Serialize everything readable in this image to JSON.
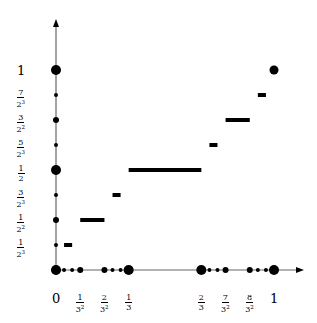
{
  "chart_data": {
    "type": "step",
    "title": "",
    "xlabel": "",
    "ylabel": "",
    "xlim": [
      0,
      1
    ],
    "ylim": [
      0,
      1
    ],
    "grid": false,
    "x_ticks": [
      {
        "value": 0,
        "num": "0",
        "den": ""
      },
      {
        "value": 0.1111,
        "num": "1",
        "den": "3",
        "den_exp": "2"
      },
      {
        "value": 0.2222,
        "num": "2",
        "den": "3",
        "den_exp": "2"
      },
      {
        "value": 0.3333,
        "num": "1",
        "den": "3"
      },
      {
        "value": 0.6667,
        "num": "2",
        "den": "3"
      },
      {
        "value": 0.7778,
        "num": "7",
        "den": "3",
        "den_exp": "2"
      },
      {
        "value": 0.8889,
        "num": "8",
        "den": "3",
        "den_exp": "2"
      },
      {
        "value": 1,
        "num": "1",
        "den": ""
      }
    ],
    "y_ticks": [
      {
        "value": 0.125,
        "num": "1",
        "den": "2",
        "den_exp": "3"
      },
      {
        "value": 0.25,
        "num": "1",
        "den": "2",
        "den_exp": "2"
      },
      {
        "value": 0.375,
        "num": "3",
        "den": "2",
        "den_exp": "3"
      },
      {
        "value": 0.5,
        "num": "1",
        "den": "2"
      },
      {
        "value": 0.625,
        "num": "5",
        "den": "2",
        "den_exp": "3"
      },
      {
        "value": 0.75,
        "num": "3",
        "den": "2",
        "den_exp": "2"
      },
      {
        "value": 0.875,
        "num": "7",
        "den": "2",
        "den_exp": "3"
      },
      {
        "value": 1,
        "num": "1",
        "den": ""
      }
    ],
    "segments": [
      {
        "x0": 0.037,
        "x1": 0.0741,
        "y": 0.125
      },
      {
        "x0": 0.1111,
        "x1": 0.2222,
        "y": 0.25
      },
      {
        "x0": 0.2593,
        "x1": 0.2963,
        "y": 0.375
      },
      {
        "x0": 0.3333,
        "x1": 0.6667,
        "y": 0.5
      },
      {
        "x0": 0.7037,
        "x1": 0.7407,
        "y": 0.625
      },
      {
        "x0": 0.7778,
        "x1": 0.8889,
        "y": 0.75
      },
      {
        "x0": 0.9259,
        "x1": 0.963,
        "y": 0.875
      }
    ],
    "points": [
      {
        "x": 0,
        "y": 0,
        "size": "large"
      },
      {
        "x": 1,
        "y": 1,
        "size": "large"
      }
    ],
    "x_axis_dots": [
      {
        "x": 0,
        "size": "large"
      },
      {
        "x": 0.037,
        "size": "small"
      },
      {
        "x": 0.0741,
        "size": "small"
      },
      {
        "x": 0.1111,
        "size": "medium"
      },
      {
        "x": 0.2222,
        "size": "medium"
      },
      {
        "x": 0.2593,
        "size": "small"
      },
      {
        "x": 0.2963,
        "size": "small"
      },
      {
        "x": 0.3333,
        "size": "large"
      },
      {
        "x": 0.6667,
        "size": "large"
      },
      {
        "x": 0.7037,
        "size": "small"
      },
      {
        "x": 0.7407,
        "size": "small"
      },
      {
        "x": 0.7778,
        "size": "medium"
      },
      {
        "x": 0.8889,
        "size": "medium"
      },
      {
        "x": 0.9259,
        "size": "small"
      },
      {
        "x": 0.963,
        "size": "small"
      },
      {
        "x": 1,
        "size": "large"
      }
    ],
    "y_axis_dots": [
      {
        "y": 0.125,
        "size": "small"
      },
      {
        "y": 0.25,
        "size": "medium"
      },
      {
        "y": 0.375,
        "size": "small"
      },
      {
        "y": 0.5,
        "size": "large"
      },
      {
        "y": 0.625,
        "size": "small"
      },
      {
        "y": 0.75,
        "size": "medium"
      },
      {
        "y": 0.875,
        "size": "small"
      },
      {
        "y": 1,
        "size": "large"
      }
    ],
    "colors": {
      "axis": "#555555",
      "data": "#000000"
    }
  }
}
